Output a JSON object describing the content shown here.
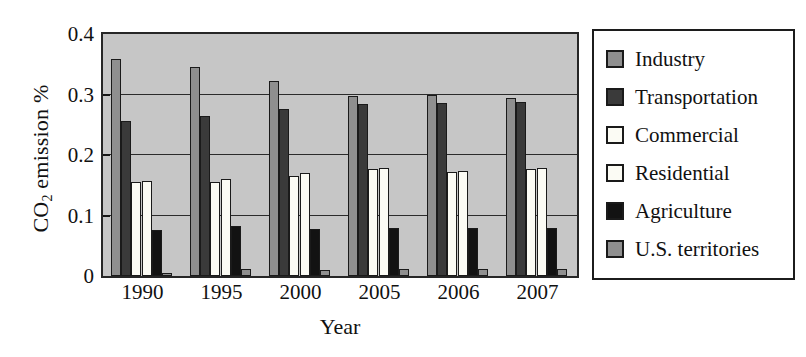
{
  "chart_data": {
    "type": "bar",
    "title": "",
    "xlabel": "Year",
    "ylabel": "CO2 emission %",
    "ylabel_html": "CO<sub>2</sub> emission %",
    "categories": [
      "1990",
      "1995",
      "2000",
      "2005",
      "2006",
      "2007"
    ],
    "ylim": [
      0,
      0.4
    ],
    "ytick_labels": [
      "0",
      "0.1",
      "0.2",
      "0.3",
      "0.4"
    ],
    "ytick_values": [
      0,
      0.1,
      0.2,
      0.3,
      0.4
    ],
    "grid": "horizontal",
    "legend_position": "right-outside",
    "plot_background": "#c6c6c6",
    "series": [
      {
        "name": "Industry",
        "color": "#8f8f8f",
        "values": [
          0.358,
          0.345,
          0.322,
          0.298,
          0.3,
          0.295
        ]
      },
      {
        "name": "Transportation",
        "color": "#3a3a3a",
        "values": [
          0.256,
          0.265,
          0.276,
          0.285,
          0.286,
          0.288
        ]
      },
      {
        "name": "Commercial",
        "color": "#fbfbf4",
        "values": [
          0.156,
          0.155,
          0.166,
          0.177,
          0.172,
          0.177
        ]
      },
      {
        "name": "Residential",
        "color": "#fbfbf4",
        "values": [
          0.157,
          0.16,
          0.17,
          0.179,
          0.173,
          0.178
        ]
      },
      {
        "name": "Agriculture",
        "color": "#121212",
        "values": [
          0.076,
          0.083,
          0.078,
          0.079,
          0.08,
          0.08
        ]
      },
      {
        "name": "U.S. territories",
        "color": "#8f8f8f",
        "values": [
          0.005,
          0.011,
          0.01,
          0.011,
          0.012,
          0.012
        ]
      }
    ]
  },
  "legend": {
    "items": [
      {
        "label": "Industry",
        "color": "#8f8f8f"
      },
      {
        "label": "Transportation",
        "color": "#3a3a3a"
      },
      {
        "label": "Commercial",
        "color": "#fbfbf4"
      },
      {
        "label": "Residential",
        "color": "#fbfbf4"
      },
      {
        "label": "Agriculture",
        "color": "#121212"
      },
      {
        "label": "U.S. territories",
        "color": "#8f8f8f"
      }
    ]
  },
  "axes": {
    "y_title_prefix": "CO",
    "y_title_sub": "2",
    "y_title_suffix": " emission %",
    "x_title": "Year"
  }
}
